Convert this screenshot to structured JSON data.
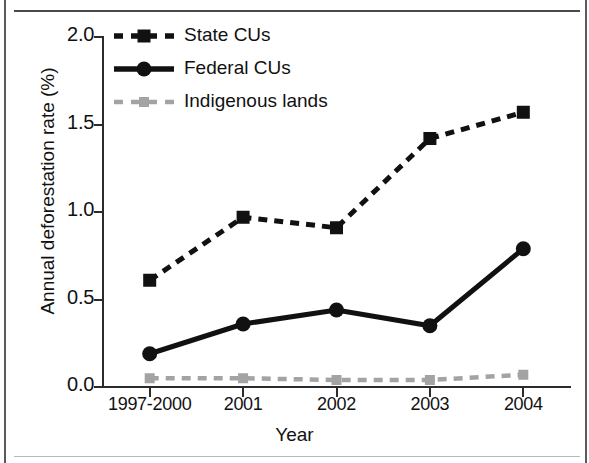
{
  "figure": {
    "axis_title_y": "Annual deforestation rate (%)",
    "axis_title_x": "Year"
  },
  "legend": {
    "items": [
      {
        "label": "State CUs",
        "color": "#111111",
        "style": "dashed",
        "marker": "square"
      },
      {
        "label": "Federal CUs",
        "color": "#111111",
        "style": "solid",
        "marker": "circle"
      },
      {
        "label": "Indigenous lands",
        "color": "#a3a3a3",
        "style": "dashed",
        "marker": "square"
      }
    ]
  },
  "chart_data": {
    "type": "line",
    "title": "",
    "xlabel": "Year",
    "ylabel": "Annual deforestation rate (%)",
    "categories": [
      "1997-2000",
      "2001",
      "2002",
      "2003",
      "2004"
    ],
    "ylim": [
      0.0,
      2.0
    ],
    "yticks": [
      "0.0",
      "0.5",
      "1.0",
      "1.5",
      "2.0"
    ],
    "ytick_values": [
      0.0,
      0.5,
      1.0,
      1.5,
      2.0
    ],
    "grid": false,
    "legend_position": "top-left",
    "series": [
      {
        "name": "State CUs",
        "color": "#111111",
        "style": "dashed",
        "marker": "square",
        "values": [
          0.61,
          0.97,
          0.91,
          1.42,
          1.57
        ]
      },
      {
        "name": "Federal CUs",
        "color": "#111111",
        "style": "solid",
        "marker": "circle",
        "values": [
          0.19,
          0.36,
          0.44,
          0.35,
          0.79
        ]
      },
      {
        "name": "Indigenous lands",
        "color": "#a3a3a3",
        "style": "dashed",
        "marker": "square",
        "values": [
          0.05,
          0.05,
          0.04,
          0.04,
          0.07
        ]
      }
    ]
  }
}
